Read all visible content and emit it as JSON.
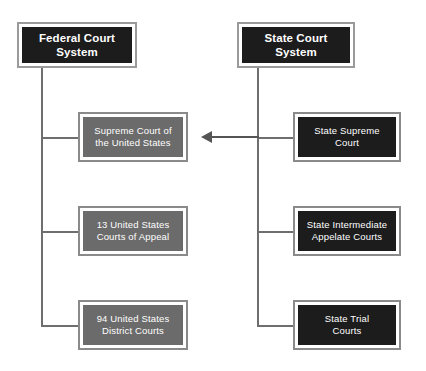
{
  "diagram": {
    "colors": {
      "dark_fill": "#1c1c1c",
      "gray_fill": "#6b6b6b",
      "border": "#8a8a8a",
      "line": "#6e6e6e",
      "arrow": "#555555",
      "background": "#ffffff",
      "text": "#ffffff"
    },
    "federal": {
      "header": {
        "label": "Federal Court System",
        "line1": "Federal Court",
        "line2": "System",
        "fill": "dark"
      },
      "courts": [
        {
          "label": "Supreme Court of the United States",
          "line1": "Supreme Court of",
          "line2": "the United States",
          "fill": "gray",
          "level": "supreme"
        },
        {
          "label": "13 United States Courts of Appeal",
          "line1": "13 United States",
          "line2": "Courts of Appeal",
          "fill": "gray",
          "level": "appellate"
        },
        {
          "label": "94 United States District Courts",
          "line1": "94 United States",
          "line2": "District Courts",
          "fill": "gray",
          "level": "trial"
        }
      ]
    },
    "state": {
      "header": {
        "label": "State Court System",
        "line1": "State Court",
        "line2": "System",
        "fill": "dark"
      },
      "courts": [
        {
          "label": "State Supreme Court",
          "line1": "State Supreme",
          "line2": "Court",
          "fill": "dark",
          "level": "supreme"
        },
        {
          "label": "State Intermediate Appelate Courts",
          "line1": "State Intermediate",
          "line2": "Appelate Courts",
          "fill": "dark",
          "level": "appellate"
        },
        {
          "label": "State Trial Courts",
          "line1": "State Trial",
          "line2": "Courts",
          "fill": "dark",
          "level": "trial"
        }
      ]
    },
    "arrow": {
      "label": "appeal-from-state-supreme-to-us-supreme",
      "direction": "left"
    }
  }
}
